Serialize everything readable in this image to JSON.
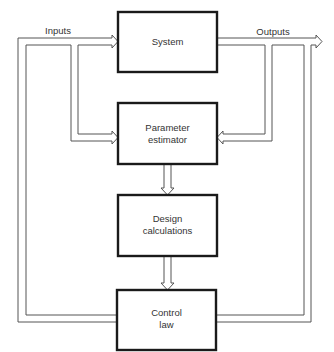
{
  "diagram": {
    "type": "block-diagram",
    "title": "",
    "signals": {
      "inputs": "Inputs",
      "outputs": "Outputs"
    },
    "blocks": [
      {
        "id": "system",
        "lines": [
          "System"
        ]
      },
      {
        "id": "parameter-estimator",
        "lines": [
          "Parameter",
          "estimator"
        ]
      },
      {
        "id": "design-calculations",
        "lines": [
          "Design",
          "calculations"
        ]
      },
      {
        "id": "control-law",
        "lines": [
          "Control",
          "law"
        ]
      }
    ],
    "connections": [
      {
        "from": "control-law",
        "to": "system",
        "label": "Inputs"
      },
      {
        "from": "control-law",
        "to": "parameter-estimator",
        "label": "Inputs"
      },
      {
        "from": "system",
        "to": "parameter-estimator",
        "label": "Outputs"
      },
      {
        "from": "system",
        "to": "control-law",
        "label": "Outputs"
      },
      {
        "from": "parameter-estimator",
        "to": "design-calculations",
        "label": ""
      },
      {
        "from": "design-calculations",
        "to": "control-law",
        "label": ""
      }
    ],
    "colors": {
      "block_stroke": "#1a1a1a",
      "connector_stroke": "#555555",
      "text": "#333333",
      "background": "#ffffff"
    }
  }
}
